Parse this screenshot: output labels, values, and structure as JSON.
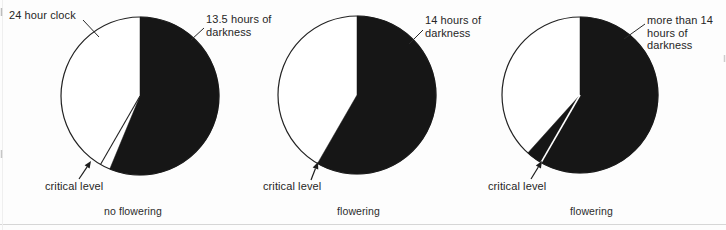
{
  "figure": {
    "ink_color": "#161616",
    "paper_color": "#fdfdfd",
    "pies": [
      {
        "clock_label": "24 hour clock",
        "darkness_label_lines": [
          "13.5 hours of",
          "darkness"
        ],
        "critical_label": "critical level",
        "caption": "no flowering",
        "dark_hours": 13.5,
        "critical_hours": 14,
        "total_hours": 24
      },
      {
        "darkness_label_lines": [
          "14 hours of",
          "darkness"
        ],
        "critical_label": "critical level",
        "caption": "flowering",
        "dark_hours": 14,
        "critical_hours": 14,
        "total_hours": 24
      },
      {
        "darkness_label_lines": [
          "more than 14",
          "hours of",
          "darkness"
        ],
        "critical_label": "critical level",
        "caption": "flowering",
        "dark_hours": 14.8,
        "critical_hours": 14,
        "total_hours": 24
      }
    ]
  },
  "chart_data": [
    {
      "type": "pie",
      "title": "24 hour clock",
      "slices": [
        {
          "label": "darkness",
          "hours": 13.5
        },
        {
          "label": "daylight",
          "hours": 10.5
        }
      ],
      "annotations": [
        "24 hour clock",
        "13.5 hours of darkness",
        "critical level"
      ],
      "caption": "no flowering"
    },
    {
      "type": "pie",
      "title": "24 hour clock",
      "slices": [
        {
          "label": "darkness",
          "hours": 14
        },
        {
          "label": "daylight",
          "hours": 10
        }
      ],
      "annotations": [
        "14 hours of darkness",
        "critical level"
      ],
      "caption": "flowering"
    },
    {
      "type": "pie",
      "title": "24 hour clock",
      "slices": [
        {
          "label": "darkness",
          "hours": 14.8,
          "shown_as": "more than 14"
        },
        {
          "label": "daylight",
          "hours": 9.2
        }
      ],
      "annotations": [
        "more than 14 hours of darkness",
        "critical level"
      ],
      "caption": "flowering"
    }
  ]
}
